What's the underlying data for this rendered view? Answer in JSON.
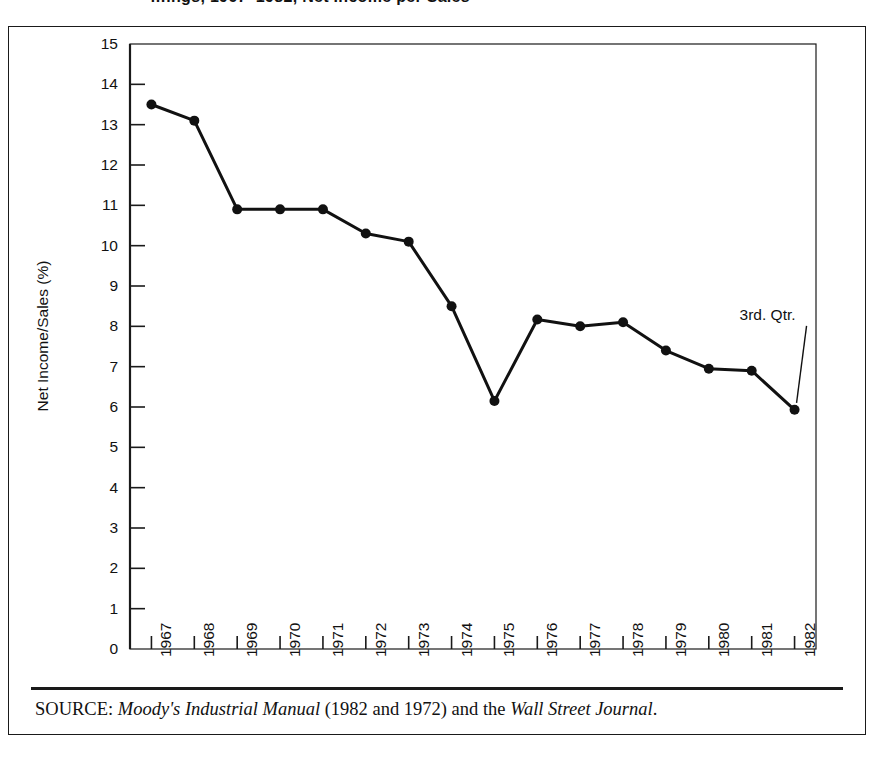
{
  "figure": {
    "cropped_title": "…ings, 1967–1982, Net Income per Sales",
    "annotation": {
      "label": "3rd. Qtr.",
      "points_to_year": "1982"
    },
    "source": {
      "prefix": "SOURCE:",
      "italic_1": "Moody's Industrial Manual",
      "middle": "(1982 and 1972) and the",
      "italic_2": "Wall Street Journal",
      "suffix": "."
    },
    "colors": {
      "line": "#111111",
      "marker": "#111111",
      "axis": "#1a1a1a",
      "background": "#ffffff",
      "text": "#111111"
    }
  },
  "chart_data": {
    "type": "line",
    "title": "",
    "xlabel": "",
    "ylabel": "Net Income/Sales (%)",
    "xlim": [
      1966.4,
      1982.6
    ],
    "ylim": [
      0,
      15
    ],
    "yticks": [
      0,
      1,
      2,
      3,
      4,
      5,
      6,
      7,
      8,
      9,
      10,
      11,
      12,
      13,
      14,
      15
    ],
    "ytick_labels": [
      "0",
      "1",
      "2",
      "3",
      "4",
      "5",
      "6",
      "7",
      "8",
      "9",
      "10",
      "11",
      "12",
      "13",
      "14",
      "15"
    ],
    "grid": false,
    "legend": false,
    "categories": [
      "1967",
      "1968",
      "1969",
      "1970",
      "1971",
      "1972",
      "1973",
      "1974",
      "1975",
      "1976",
      "1977",
      "1978",
      "1979",
      "1980",
      "1981",
      "1982"
    ],
    "values": [
      13.5,
      13.1,
      10.9,
      10.9,
      10.9,
      10.3,
      10.1,
      8.5,
      6.15,
      8.17,
      8.0,
      8.1,
      7.4,
      6.95,
      6.9,
      5.93
    ],
    "markers": "filled-circle",
    "annotations": [
      {
        "text": "3rd. Qtr.",
        "target_category": "1982",
        "target_value": 5.93
      }
    ]
  }
}
